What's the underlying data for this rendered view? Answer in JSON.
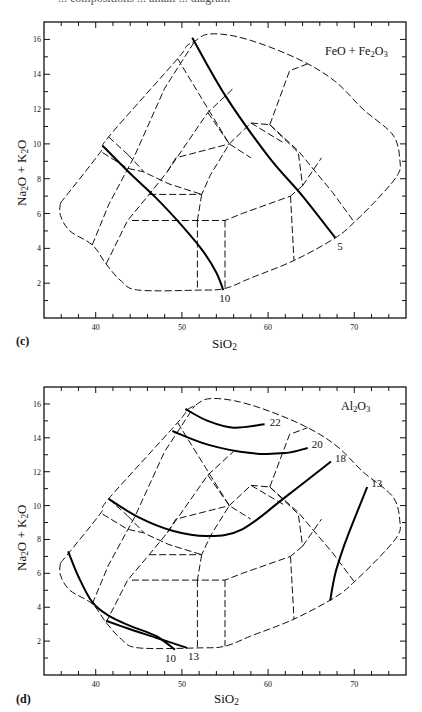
{
  "page": {
    "top_caption_fragment": "... compositions ... alkali ... diagram"
  },
  "panels": [
    {
      "id": "c",
      "letter": "(c)",
      "oxide_label": "FeO + Fe2O3",
      "oxide_html": "FeO + Fe<sub>2</sub>O<sub>3</sub>",
      "xlabel": "SiO2",
      "ylabel": "Na2O + K2O"
    },
    {
      "id": "d",
      "letter": "(d)",
      "oxide_label": "Al2O3",
      "oxide_html": "Al<sub>2</sub>O<sub>3</sub>",
      "xlabel": "SiO2",
      "ylabel": "Na2O + K2O"
    }
  ],
  "chart_data": [
    {
      "type": "line",
      "panel": "(c)",
      "title": "FeO + Fe2O3",
      "xlabel": "SiO2",
      "ylabel": "Na2O + K2O",
      "xlim": [
        34,
        76
      ],
      "ylim": [
        0,
        17
      ],
      "x_ticks": [
        40,
        50,
        60,
        70
      ],
      "y_ticks": [
        2,
        4,
        6,
        8,
        10,
        12,
        14,
        16
      ],
      "x_minor_step": 2,
      "y_minor_step": 1,
      "grid": false,
      "background_field_boundaries": "dashed TAS-style classification fields",
      "series": [
        {
          "name": "5",
          "style": "solid-contour",
          "points": [
            [
              51.2,
              16.1
            ],
            [
              55,
              12.8
            ],
            [
              60,
              9.3
            ],
            [
              64,
              7.0
            ],
            [
              67.8,
              4.6
            ]
          ]
        },
        {
          "name": "10",
          "style": "solid-contour",
          "points": [
            [
              40.8,
              9.9
            ],
            [
              44,
              8.3
            ],
            [
              47,
              6.9
            ],
            [
              50,
              5.3
            ],
            [
              52.5,
              3.8
            ],
            [
              54,
              2.6
            ],
            [
              54.8,
              1.6
            ]
          ]
        }
      ]
    },
    {
      "type": "line",
      "panel": "(d)",
      "title": "Al2O3",
      "xlabel": "SiO2",
      "ylabel": "Na2O + K2O",
      "xlim": [
        34,
        76
      ],
      "ylim": [
        0,
        17
      ],
      "x_ticks": [
        40,
        50,
        60,
        70
      ],
      "y_ticks": [
        2,
        4,
        6,
        8,
        10,
        12,
        14,
        16
      ],
      "x_minor_step": 2,
      "y_minor_step": 1,
      "grid": false,
      "background_field_boundaries": "dashed TAS-style classification fields",
      "series": [
        {
          "name": "22",
          "style": "solid-contour",
          "points": [
            [
              50.4,
              15.7
            ],
            [
              53,
              15.0
            ],
            [
              56,
              14.6
            ],
            [
              59.6,
              14.8
            ]
          ]
        },
        {
          "name": "20",
          "style": "solid-contour",
          "points": [
            [
              48.9,
              14.4
            ],
            [
              53,
              13.6
            ],
            [
              58,
              13.1
            ],
            [
              62,
              13.1
            ],
            [
              64.6,
              13.4
            ]
          ]
        },
        {
          "name": "18",
          "style": "solid-contour",
          "points": [
            [
              41.5,
              10.4
            ],
            [
              45,
              9.3
            ],
            [
              49,
              8.5
            ],
            [
              53,
              8.2
            ],
            [
              57,
              8.6
            ],
            [
              62,
              10.5
            ],
            [
              67.3,
              12.6
            ]
          ]
        },
        {
          "name": "13",
          "style": "solid-contour",
          "points": [
            [
              71.5,
              11.1
            ],
            [
              70,
              9.2
            ],
            [
              68.8,
              7.6
            ],
            [
              67.8,
              6.0
            ],
            [
              67.2,
              4.4
            ]
          ]
        },
        {
          "name": "10",
          "style": "solid-contour",
          "points": [
            [
              36.8,
              7.3
            ],
            [
              38,
              5.8
            ],
            [
              39.6,
              4.3
            ],
            [
              41.5,
              3.5
            ],
            [
              44,
              2.9
            ],
            [
              47,
              2.3
            ],
            [
              49.2,
              1.5
            ]
          ]
        },
        {
          "name": "13",
          "style": "solid-contour",
          "points": [
            [
              41.2,
              3.2
            ],
            [
              44,
              2.7
            ],
            [
              47,
              2.2
            ],
            [
              50.6,
              1.6
            ]
          ]
        }
      ]
    }
  ]
}
